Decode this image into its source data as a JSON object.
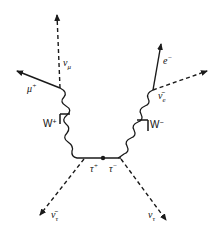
{
  "diagram": {
    "type": "feynman",
    "colors": {
      "line": "#1a1a1a",
      "background": "#ffffff"
    },
    "particles": {
      "mu_plus": {
        "symbol": "μ",
        "charge": "+"
      },
      "nu_mu": {
        "symbol": "ν",
        "sub": "μ"
      },
      "electron": {
        "symbol": "e",
        "charge": "−"
      },
      "anti_nu_e": {
        "symbol": "ν̄",
        "sub": "e"
      },
      "w_plus": {
        "symbol": "W",
        "charge": "+"
      },
      "w_minus": {
        "symbol": "W",
        "charge": "−"
      },
      "tau_plus": {
        "symbol": "τ",
        "charge": "+"
      },
      "tau_minus": {
        "symbol": "τ",
        "charge": "−"
      },
      "anti_nu_tau": {
        "symbol": "ν̄",
        "sub": "τ"
      },
      "nu_tau": {
        "symbol": "ν",
        "sub": "τ"
      }
    }
  }
}
